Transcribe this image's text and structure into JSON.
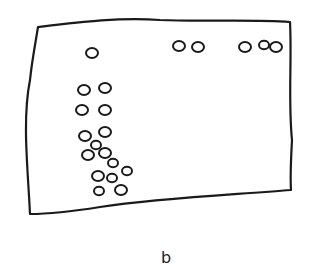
{
  "figure": {
    "label": "b",
    "stroke_color": "#1a1a1a",
    "background": "#ffffff",
    "frame": {
      "shape": "hand-drawn quadrilateral",
      "corners": [
        [
          38,
          27
        ],
        [
          290,
          22
        ],
        [
          291,
          190
        ],
        [
          30,
          214
        ]
      ]
    },
    "circles": [
      {
        "cx": 92,
        "cy": 53,
        "r": 6
      },
      {
        "cx": 179,
        "cy": 46,
        "r": 6
      },
      {
        "cx": 198,
        "cy": 47,
        "r": 6
      },
      {
        "cx": 245,
        "cy": 47,
        "r": 6
      },
      {
        "cx": 264,
        "cy": 45,
        "r": 5
      },
      {
        "cx": 276,
        "cy": 47,
        "r": 6
      },
      {
        "cx": 84,
        "cy": 90,
        "r": 6
      },
      {
        "cx": 105,
        "cy": 88,
        "r": 6
      },
      {
        "cx": 82,
        "cy": 110,
        "r": 6
      },
      {
        "cx": 105,
        "cy": 110,
        "r": 6
      },
      {
        "cx": 85,
        "cy": 136,
        "r": 6
      },
      {
        "cx": 105,
        "cy": 132,
        "r": 6
      },
      {
        "cx": 96,
        "cy": 145,
        "r": 5
      },
      {
        "cx": 88,
        "cy": 155,
        "r": 6
      },
      {
        "cx": 105,
        "cy": 153,
        "r": 6
      },
      {
        "cx": 113,
        "cy": 163,
        "r": 5
      },
      {
        "cx": 98,
        "cy": 176,
        "r": 6
      },
      {
        "cx": 112,
        "cy": 178,
        "r": 5
      },
      {
        "cx": 127,
        "cy": 171,
        "r": 5
      },
      {
        "cx": 99,
        "cy": 191,
        "r": 5
      },
      {
        "cx": 121,
        "cy": 190,
        "r": 6
      }
    ]
  }
}
